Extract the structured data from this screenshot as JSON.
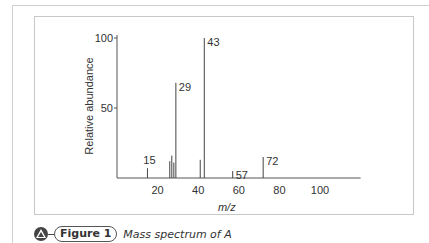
{
  "caption": {
    "figure_label": "Figure 1",
    "text": "Mass spectrum of A",
    "icon": "triangle-badge-icon"
  },
  "chart_data": {
    "type": "bar",
    "title": "",
    "xlabel": "m/z",
    "ylabel": "Relative abundance",
    "xlim": [
      0,
      120
    ],
    "ylim": [
      0,
      100
    ],
    "xticks": [
      20,
      40,
      60,
      80,
      100
    ],
    "yticks": [
      50,
      100
    ],
    "grid": false,
    "legend": null,
    "x": [
      15,
      26,
      27,
      28,
      29,
      41,
      43,
      57,
      72
    ],
    "values": [
      7,
      12,
      16,
      11,
      68,
      13,
      100,
      5,
      15
    ],
    "annotations": [
      {
        "x": 15,
        "label": "15"
      },
      {
        "x": 29,
        "label": "29"
      },
      {
        "x": 43,
        "label": "43"
      },
      {
        "x": 57,
        "label": "57"
      },
      {
        "x": 72,
        "label": "72"
      }
    ],
    "colors": {
      "line": "#444444",
      "axis": "#555555",
      "text": "#333333"
    }
  }
}
